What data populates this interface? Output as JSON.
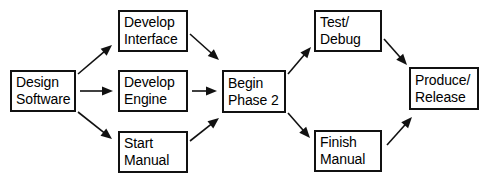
{
  "diagram": {
    "type": "flowchart",
    "background_color": "#ffffff",
    "box_border_color": "#111111",
    "text_color": "#000000",
    "arrow_color": "#111111",
    "nodes": [
      {
        "id": "design-software",
        "line1": "Design",
        "line2": "Software",
        "x": 10,
        "y": 70,
        "w": 66,
        "h": 42
      },
      {
        "id": "develop-interface",
        "line1": "Develop",
        "line2": "Interface",
        "x": 118,
        "y": 10,
        "w": 70,
        "h": 42
      },
      {
        "id": "develop-engine",
        "line1": "Develop",
        "line2": "Engine",
        "x": 118,
        "y": 70,
        "w": 70,
        "h": 42
      },
      {
        "id": "start-manual",
        "line1": "Start",
        "line2": "Manual",
        "x": 118,
        "y": 131,
        "w": 70,
        "h": 42
      },
      {
        "id": "begin-phase-2",
        "line1": "Begin",
        "line2": "Phase 2",
        "x": 222,
        "y": 70,
        "w": 64,
        "h": 43
      },
      {
        "id": "test-debug",
        "line1": "Test/",
        "line2": "Debug",
        "x": 314,
        "y": 10,
        "w": 68,
        "h": 42
      },
      {
        "id": "finish-manual",
        "line1": "Finish",
        "line2": "Manual",
        "x": 314,
        "y": 130,
        "w": 68,
        "h": 42
      },
      {
        "id": "produce-release",
        "line1": "Produce/",
        "line2": "Release",
        "x": 409,
        "y": 67,
        "w": 70,
        "h": 43
      }
    ],
    "edges": [
      {
        "id": "design-to-interface",
        "from": "design-software",
        "to": "develop-interface",
        "x1": 78,
        "y1": 74,
        "x2": 112,
        "y2": 45
      },
      {
        "id": "design-to-engine",
        "from": "design-software",
        "to": "develop-engine",
        "x1": 80,
        "y1": 91,
        "x2": 113,
        "y2": 91
      },
      {
        "id": "design-to-start-manual",
        "from": "design-software",
        "to": "start-manual",
        "x1": 78,
        "y1": 112,
        "x2": 112,
        "y2": 139
      },
      {
        "id": "interface-to-begin",
        "from": "develop-interface",
        "to": "begin-phase-2",
        "x1": 190,
        "y1": 34,
        "x2": 219,
        "y2": 60
      },
      {
        "id": "engine-to-begin",
        "from": "develop-engine",
        "to": "begin-phase-2",
        "x1": 192,
        "y1": 91,
        "x2": 217,
        "y2": 91
      },
      {
        "id": "start-manual-to-begin",
        "from": "start-manual",
        "to": "begin-phase-2",
        "x1": 190,
        "y1": 141,
        "x2": 219,
        "y2": 118
      },
      {
        "id": "begin-to-test-debug",
        "from": "begin-phase-2",
        "to": "test-debug",
        "x1": 288,
        "y1": 74,
        "x2": 311,
        "y2": 47
      },
      {
        "id": "begin-to-finish-manual",
        "from": "begin-phase-2",
        "to": "finish-manual",
        "x1": 288,
        "y1": 113,
        "x2": 310,
        "y2": 138
      },
      {
        "id": "test-debug-to-produce",
        "from": "test-debug",
        "to": "produce-release",
        "x1": 384,
        "y1": 39,
        "x2": 407,
        "y2": 65
      },
      {
        "id": "finish-manual-to-produce",
        "from": "finish-manual",
        "to": "produce-release",
        "x1": 387,
        "y1": 145,
        "x2": 412,
        "y2": 117
      }
    ]
  }
}
